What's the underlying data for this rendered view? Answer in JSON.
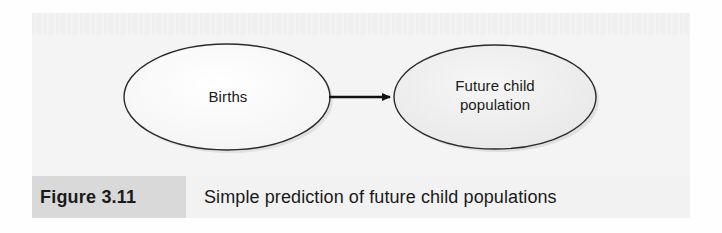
{
  "figure": {
    "caption_number": "Figure 3.11",
    "caption_text": "Simple prediction of future child populations",
    "nodes": [
      {
        "id": "births",
        "label": "Births"
      },
      {
        "id": "future-child-population",
        "label": "Future child\npopulation"
      }
    ],
    "edges": [
      {
        "from": "births",
        "to": "future-child-population",
        "style": "solid-arrow"
      }
    ],
    "colors": {
      "page_background": "#ffffff",
      "panel_background": "#f4f4f4",
      "caption_bar_background": "#f2f2f2",
      "caption_number_block_background": "#d9d9d9",
      "node_outline": "#2b2b2b",
      "node_fill_left": "#fbfbfb",
      "node_fill_right": "#ededed",
      "arrow_color": "#111111",
      "text_color": "#1a1a1a"
    }
  }
}
